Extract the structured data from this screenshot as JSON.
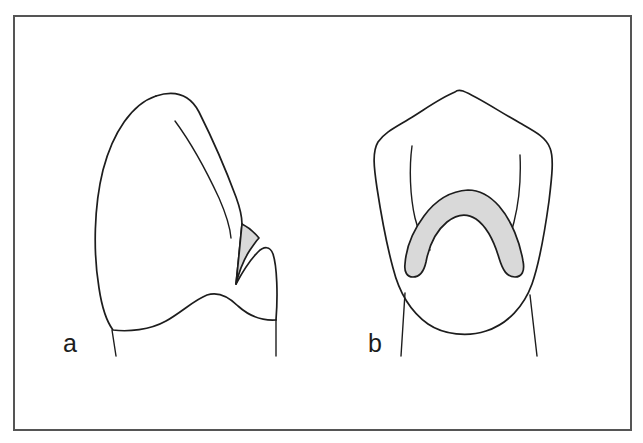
{
  "figure": {
    "type": "line-drawing",
    "background_color": "#ffffff",
    "border_color": "#555555",
    "stroke_color": "#1d1d1d",
    "shading_color": "#d9d9d9",
    "frame": {
      "x": 13,
      "y": 15,
      "width": 619,
      "height": 416
    },
    "panels": [
      {
        "id": "a",
        "label": "a",
        "label_x": 63,
        "label_y": 352,
        "view": "proximal-lateral-view",
        "has_shaded_region": true,
        "shaded_region_shape": "narrow-sliver",
        "shaded_region_color": "#d9d9d9"
      },
      {
        "id": "b",
        "label": "b",
        "label_x": 368,
        "label_y": 352,
        "view": "occlusal-view",
        "has_shaded_region": true,
        "shaded_region_shape": "crescent",
        "shaded_region_color": "#d9d9d9"
      }
    ]
  }
}
